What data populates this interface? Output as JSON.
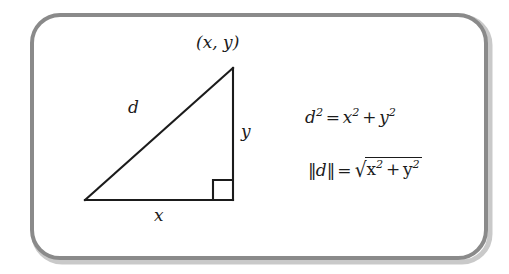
{
  "figure": {
    "name": "distance-formula-right-triangle",
    "background_color": "#ffffff",
    "border": {
      "color": "#8a8a8a",
      "style": "rounded-rectangle",
      "thickness_px": 4,
      "corner_radius_px": 28
    },
    "stroke_color": "#1b1b1b"
  },
  "diagram": {
    "vertex_label": "(x, y)",
    "hypotenuse_label": "d",
    "vertical_leg_label": "y",
    "horizontal_leg_label": "x",
    "right_angle_marker": "right-angle-square",
    "triangle_points": {
      "origin": "85,200",
      "corner": "233,200",
      "apex": "233,68"
    }
  },
  "equations": {
    "equation_1": {
      "lhs_base": "d",
      "lhs_exponent": "2",
      "equals": "=",
      "term_1_base": "x",
      "term_1_exponent": "2",
      "plus": "+",
      "term_2_base": "y",
      "term_2_exponent": "2",
      "plain_text": "d² = x² + y²"
    },
    "equation_2": {
      "norm_open": "‖",
      "norm_variable": "d",
      "norm_close": "‖",
      "equals": "=",
      "radical_sign": "√",
      "term_1_base": "x",
      "term_1_exponent": "2",
      "plus": "+",
      "term_2_base": "y",
      "term_2_exponent": "2",
      "plain_text": "‖d‖ = √(x² + y²)"
    }
  }
}
